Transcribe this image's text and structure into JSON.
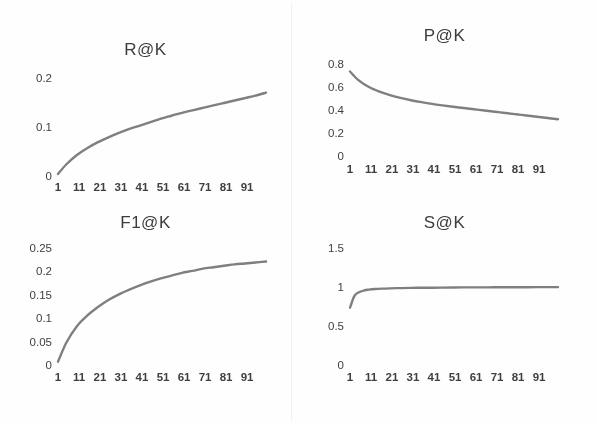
{
  "figure": {
    "name": "evaluation-metric-curves",
    "background_color": "#fefefe",
    "curve_color": "#7f7f7f",
    "text_color": "#3f3f3f"
  },
  "panels": [
    {
      "id": "r-at-k",
      "title": "R@K",
      "chart_index": 0
    },
    {
      "id": "p-at-k",
      "title": "P@K",
      "chart_index": 1
    },
    {
      "id": "f1-at-k",
      "title": "F1@K",
      "chart_index": 2
    },
    {
      "id": "s-at-k",
      "title": "S@K",
      "chart_index": 3
    }
  ],
  "chart_data": [
    {
      "type": "line",
      "title": "R@K",
      "xlabel": "",
      "ylabel": "",
      "legend": [],
      "grid": false,
      "xlim": [
        1,
        100
      ],
      "ylim": [
        0,
        0.2
      ],
      "xticks": [
        1,
        11,
        21,
        31,
        41,
        51,
        61,
        71,
        81,
        91
      ],
      "xticklabels": [
        "1",
        "11",
        "21",
        "31",
        "41",
        "51",
        "61",
        "71",
        "81",
        "91"
      ],
      "yticks": [
        0,
        0.1,
        0.2
      ],
      "yticklabels": [
        "0",
        "0.1",
        "0.2"
      ],
      "series": [
        {
          "name": "R@K",
          "color": "#7f7f7f",
          "x": [
            1,
            5,
            10,
            15,
            20,
            25,
            30,
            35,
            40,
            45,
            50,
            55,
            60,
            65,
            70,
            75,
            80,
            85,
            90,
            95,
            100
          ],
          "values": [
            0.004,
            0.024,
            0.043,
            0.057,
            0.069,
            0.079,
            0.088,
            0.096,
            0.103,
            0.11,
            0.117,
            0.123,
            0.129,
            0.134,
            0.139,
            0.144,
            0.149,
            0.154,
            0.159,
            0.164,
            0.17
          ]
        }
      ]
    },
    {
      "type": "line",
      "title": "P@K",
      "xlabel": "",
      "ylabel": "",
      "legend": [],
      "grid": false,
      "xlim": [
        1,
        100
      ],
      "ylim": [
        0,
        0.8
      ],
      "xticks": [
        1,
        11,
        21,
        31,
        41,
        51,
        61,
        71,
        81,
        91
      ],
      "xticklabels": [
        "1",
        "11",
        "21",
        "31",
        "41",
        "51",
        "61",
        "71",
        "81",
        "91"
      ],
      "yticks": [
        0,
        0.2,
        0.4,
        0.6,
        0.8
      ],
      "yticklabels": [
        "0",
        "0.2",
        "0.4",
        "0.6",
        "0.8"
      ],
      "series": [
        {
          "name": "P@K",
          "color": "#7f7f7f",
          "x": [
            1,
            5,
            10,
            15,
            20,
            25,
            30,
            35,
            40,
            45,
            50,
            55,
            60,
            65,
            70,
            75,
            80,
            85,
            90,
            95,
            100
          ],
          "values": [
            0.735,
            0.66,
            0.6,
            0.56,
            0.53,
            0.505,
            0.485,
            0.468,
            0.453,
            0.44,
            0.428,
            0.417,
            0.406,
            0.396,
            0.385,
            0.374,
            0.363,
            0.352,
            0.341,
            0.33,
            0.32
          ]
        }
      ]
    },
    {
      "type": "line",
      "title": "F1@K",
      "xlabel": "",
      "ylabel": "",
      "legend": [],
      "grid": false,
      "xlim": [
        1,
        100
      ],
      "ylim": [
        0,
        0.25
      ],
      "xticks": [
        1,
        11,
        21,
        31,
        41,
        51,
        61,
        71,
        81,
        91
      ],
      "xticklabels": [
        "1",
        "11",
        "21",
        "31",
        "41",
        "51",
        "61",
        "71",
        "81",
        "91"
      ],
      "yticks": [
        0,
        0.05,
        0.1,
        0.15,
        0.2,
        0.25
      ],
      "yticklabels": [
        "0",
        "0.05",
        "0.1",
        "0.15",
        "0.2",
        "0.25"
      ],
      "series": [
        {
          "name": "F1@K",
          "color": "#7f7f7f",
          "x": [
            1,
            5,
            10,
            15,
            20,
            25,
            30,
            35,
            40,
            45,
            50,
            55,
            60,
            65,
            70,
            75,
            80,
            85,
            90,
            95,
            100
          ],
          "values": [
            0.007,
            0.048,
            0.083,
            0.106,
            0.124,
            0.139,
            0.151,
            0.161,
            0.17,
            0.178,
            0.185,
            0.191,
            0.197,
            0.201,
            0.206,
            0.209,
            0.212,
            0.215,
            0.217,
            0.219,
            0.221
          ]
        }
      ]
    },
    {
      "type": "line",
      "title": "S@K",
      "xlabel": "",
      "ylabel": "",
      "legend": [],
      "grid": false,
      "xlim": [
        1,
        100
      ],
      "ylim": [
        0,
        1.5
      ],
      "xticks": [
        1,
        11,
        21,
        31,
        41,
        51,
        61,
        71,
        81,
        91
      ],
      "xticklabels": [
        "1",
        "11",
        "21",
        "31",
        "41",
        "51",
        "61",
        "71",
        "81",
        "91"
      ],
      "yticks": [
        0,
        0.5,
        1,
        1.5
      ],
      "yticklabels": [
        "0",
        "0.5",
        "1",
        "1.5"
      ],
      "series": [
        {
          "name": "S@K",
          "color": "#7f7f7f",
          "x": [
            1,
            3,
            5,
            8,
            10,
            13,
            16,
            20,
            25,
            30,
            35,
            40,
            45,
            50,
            55,
            60,
            70,
            80,
            90,
            100
          ],
          "values": [
            0.735,
            0.88,
            0.93,
            0.958,
            0.966,
            0.974,
            0.979,
            0.983,
            0.986,
            0.989,
            0.99,
            0.991,
            0.992,
            0.994,
            0.995,
            0.995,
            0.996,
            0.997,
            0.998,
            0.999
          ]
        }
      ]
    }
  ]
}
